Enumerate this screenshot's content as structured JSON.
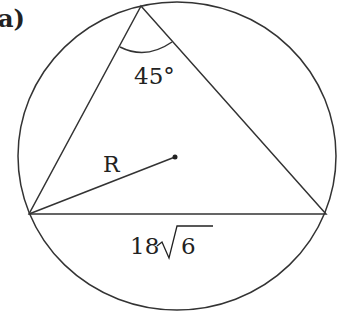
{
  "figure_label": "a)",
  "angle_label": "45°",
  "radius_label": "R",
  "side_label_coef": "18",
  "side_label_radicand": "6",
  "colors": {
    "stroke": "#333333",
    "background": "#ffffff"
  }
}
